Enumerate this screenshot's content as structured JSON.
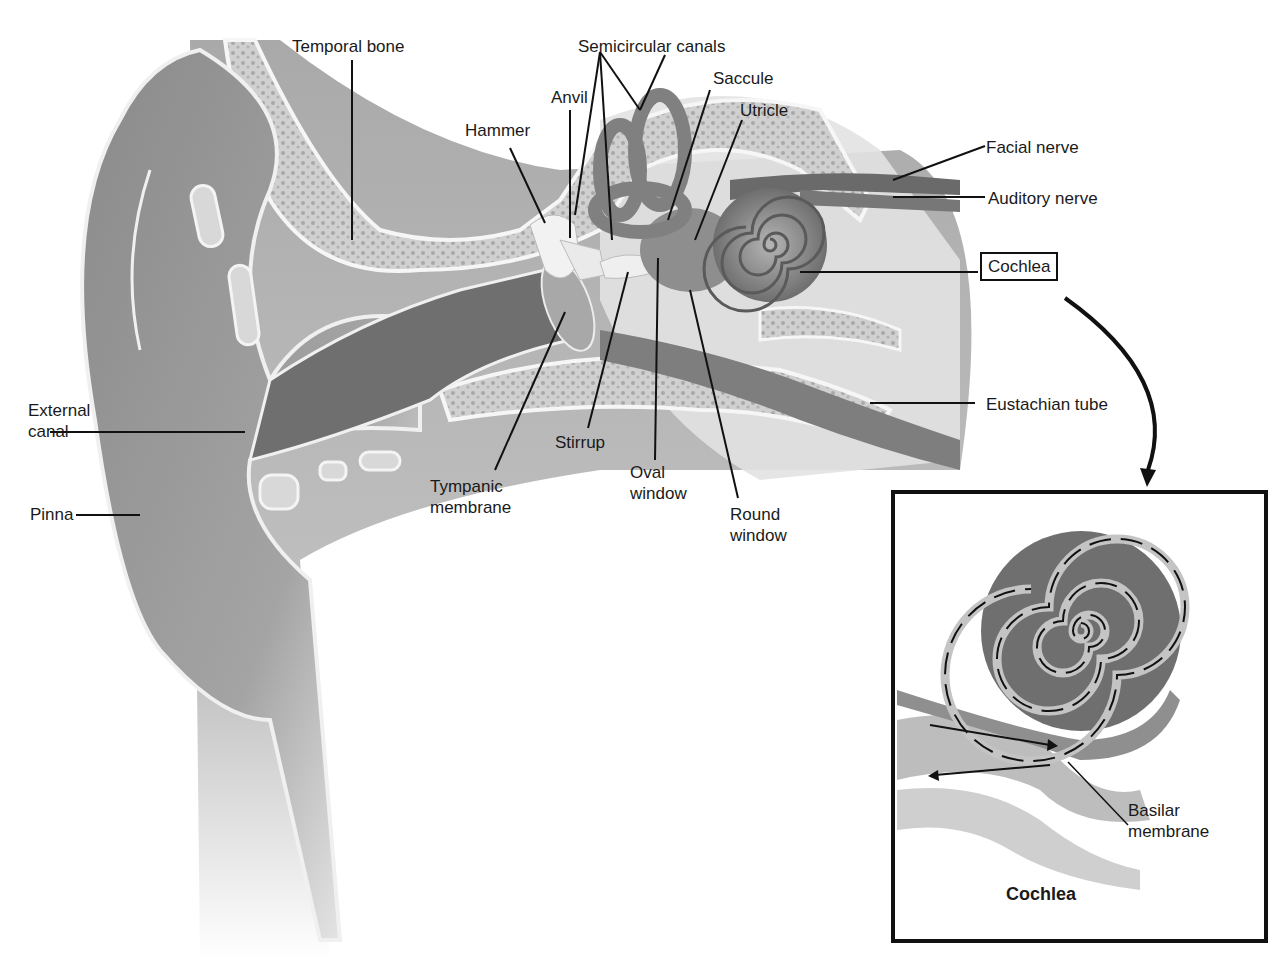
{
  "diagram": {
    "labels": {
      "temporal_bone": "Temporal bone",
      "semicircular_canals": "Semicircular canals",
      "saccule": "Saccule",
      "utricle": "Utricle",
      "anvil": "Anvil",
      "hammer": "Hammer",
      "facial_nerve": "Facial nerve",
      "auditory_nerve": "Auditory nerve",
      "cochlea": "Cochlea",
      "eustachian_tube": "Eustachian tube",
      "external_canal": "External\ncanal",
      "pinna": "Pinna",
      "stirrup": "Stirrup",
      "tympanic_membrane": "Tympanic\nmembrane",
      "oval_window": "Oval\nwindow",
      "round_window": "Round\nwindow"
    },
    "inset": {
      "title": "Cochlea",
      "basilar_membrane": "Basilar\nmembrane"
    },
    "colors": {
      "tissue_dark": "#7a7a7a",
      "tissue_mid": "#9c9c9c",
      "tissue_light": "#c8c8c8",
      "bone": "#d6d6d6",
      "outline": "#f4f4f4",
      "leader": "#111111"
    }
  }
}
